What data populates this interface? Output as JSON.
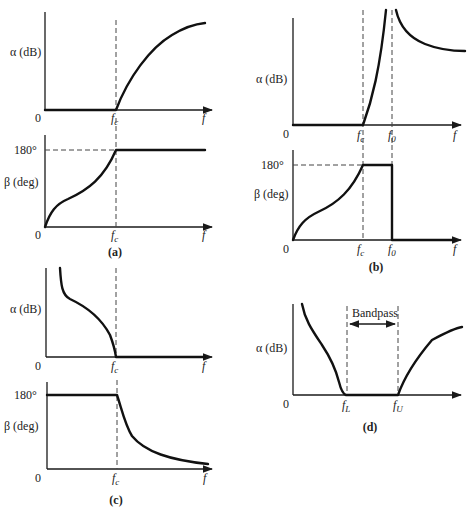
{
  "figure": {
    "panels": [
      {
        "id": "a",
        "caption": "(a)",
        "attenuation_plot": {
          "ylabel": "α (dB)",
          "origin_label": "0",
          "xlabel": "f",
          "ticks": [
            {
              "label": "f",
              "sub": "c"
            }
          ],
          "description": "Zero attenuation below fc, rising attenuation above fc (low-pass)"
        },
        "phase_plot": {
          "ylabel": "β (deg)",
          "ylevel": "180°",
          "origin_label": "0",
          "xlabel": "f",
          "ticks": [
            {
              "label": "f",
              "sub": "c"
            }
          ],
          "description": "Phase rises from 0 to 180° at fc then stays at 180°"
        }
      },
      {
        "id": "b",
        "caption": "(b)",
        "attenuation_plot": {
          "ylabel": "α (dB)",
          "origin_label": "0",
          "xlabel": "f",
          "ticks": [
            {
              "label": "f",
              "sub": "c"
            },
            {
              "label": "f",
              "sub": "0"
            }
          ],
          "description": "Zero attenuation below fc, rises to infinity at f0, then decreases"
        },
        "phase_plot": {
          "ylabel": "β (deg)",
          "ylevel": "180°",
          "origin_label": "0",
          "xlabel": "f",
          "ticks": [
            {
              "label": "f",
              "sub": "c"
            },
            {
              "label": "f",
              "sub": "0"
            }
          ],
          "description": "Phase rises to 180° at fc, holds until f0, drops to 0"
        }
      },
      {
        "id": "c",
        "caption": "(c)",
        "attenuation_plot": {
          "ylabel": "α (dB)",
          "origin_label": "0",
          "xlabel": "f",
          "ticks": [
            {
              "label": "f",
              "sub": "c"
            }
          ],
          "description": "High attenuation at low frequency falling to zero at fc (high-pass)"
        },
        "phase_plot": {
          "ylabel": "β (deg)",
          "ylevel": "180°",
          "origin_label": "0",
          "xlabel": "f",
          "ticks": [
            {
              "label": "f",
              "sub": "c"
            }
          ],
          "description": "Phase at 180° until fc, then decays toward 0"
        }
      },
      {
        "id": "d",
        "caption": "(d)",
        "attenuation_plot": {
          "ylabel": "α (dB)",
          "origin_label": "0",
          "xlabel": "",
          "ticks": [
            {
              "label": "f",
              "sub": "L"
            },
            {
              "label": "f",
              "sub": "U"
            }
          ],
          "band_label": "Bandpass",
          "description": "Attenuation zero between fL and fU (band-pass)"
        }
      }
    ]
  }
}
